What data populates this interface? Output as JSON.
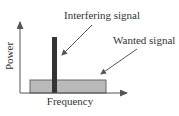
{
  "diagram": {
    "labels": {
      "interfering": "Interfering signal",
      "wanted": "Wanted signal",
      "x_axis": "Frequency",
      "y_axis": "Power"
    },
    "colors": {
      "axis": "#555555",
      "wanted_fill": "#b9b9b9",
      "wanted_stroke": "#666666",
      "interfering_fill": "#333333",
      "arrow": "#555555",
      "text": "#333333"
    }
  }
}
